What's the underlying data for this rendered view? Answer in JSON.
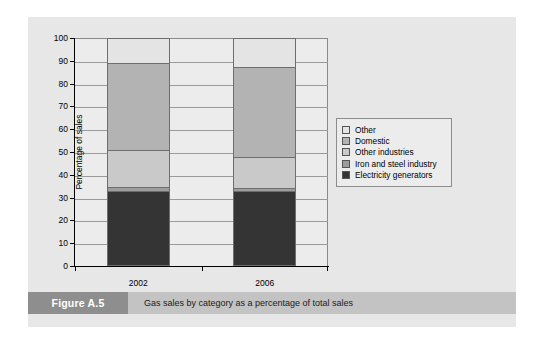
{
  "figure": {
    "tag": "Figure A.5",
    "caption": "Gas sales by category as a percentage of total sales"
  },
  "chart_data": {
    "type": "bar",
    "stacked": true,
    "title": "",
    "xlabel": "",
    "ylabel": "Percentage of sales",
    "categories": [
      "2002",
      "2006"
    ],
    "ylim": [
      0,
      100
    ],
    "yticks": [
      0,
      10,
      20,
      30,
      40,
      50,
      60,
      70,
      80,
      90,
      100
    ],
    "ytick_labels": [
      "0",
      "10",
      "20",
      "30",
      "40",
      "50",
      "60",
      "70",
      "80",
      "90",
      "100"
    ],
    "grid": true,
    "legend_position": "right",
    "series": [
      {
        "name": "Electricity generators",
        "values": [
          33.0,
          33.0
        ],
        "color": "#343434"
      },
      {
        "name": "Iron and steel industry",
        "values": [
          1.5,
          1.0
        ],
        "color": "#9d9d9d"
      },
      {
        "name": "Other industries",
        "values": [
          16.5,
          14.0
        ],
        "color": "#c9c9c9"
      },
      {
        "name": "Domestic",
        "values": [
          38.0,
          39.5
        ],
        "color": "#b3b3b3"
      },
      {
        "name": "Other",
        "values": [
          11.0,
          12.5
        ],
        "color": "#e4e4e4"
      }
    ],
    "legend_order": [
      "Other",
      "Domestic",
      "Other industries",
      "Iron and steel industry",
      "Electricity generators"
    ]
  }
}
